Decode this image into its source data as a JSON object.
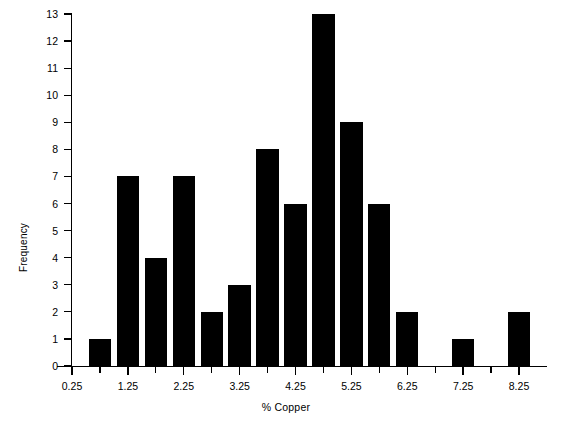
{
  "chart_data": {
    "type": "bar",
    "title": "",
    "subtitle": "",
    "xlabel": "% Copper",
    "ylabel": "Frequency",
    "xlim": [
      0.0,
      8.75
    ],
    "ylim": [
      0,
      13
    ],
    "grid": false,
    "legend": null,
    "bar_color": "#000000",
    "background_color": "#ffffff",
    "bin_width": 0.5,
    "note": "Histogram of % Copper; bars centered on 0.5-unit tick positions",
    "x_tick_labels": [
      "0.25",
      "1.25",
      "2.25",
      "3.25",
      "4.25",
      "5.25",
      "6.25",
      "7.25",
      "8.25"
    ],
    "x_tick_values": [
      0.25,
      1.25,
      2.25,
      3.25,
      4.25,
      5.25,
      6.25,
      7.25,
      8.25
    ],
    "x_minor_tick_values": [
      0.75,
      1.75,
      2.75,
      3.75,
      4.75,
      5.75,
      6.75,
      7.75
    ],
    "y_tick_labels": [
      "0",
      "1",
      "2",
      "3",
      "4",
      "5",
      "6",
      "7",
      "8",
      "9",
      "10",
      "11",
      "12",
      "13"
    ],
    "y_tick_values": [
      0,
      1,
      2,
      3,
      4,
      5,
      6,
      7,
      8,
      9,
      10,
      11,
      12,
      13
    ],
    "categories": [
      "0.25",
      "0.75",
      "1.25",
      "1.75",
      "2.25",
      "2.75",
      "3.25",
      "3.75",
      "4.25",
      "4.75",
      "5.25",
      "5.75",
      "6.25",
      "6.75",
      "7.25",
      "7.75",
      "8.25"
    ],
    "x": [
      0.25,
      0.75,
      1.25,
      1.75,
      2.25,
      2.75,
      3.25,
      3.75,
      4.25,
      4.75,
      5.25,
      5.75,
      6.25,
      6.75,
      7.25,
      7.75,
      8.25
    ],
    "values": [
      0,
      1,
      7,
      4,
      7,
      2,
      3,
      8,
      6,
      13,
      9,
      6,
      2,
      0,
      1,
      0,
      2
    ],
    "series": [
      {
        "name": "Frequency",
        "values": [
          0,
          1,
          7,
          4,
          7,
          2,
          3,
          8,
          6,
          13,
          9,
          6,
          2,
          0,
          1,
          0,
          2
        ]
      }
    ]
  }
}
